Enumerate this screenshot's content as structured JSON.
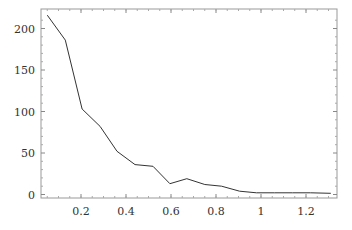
{
  "chart_data": {
    "type": "line",
    "title": "",
    "xlabel": "",
    "ylabel": "",
    "xlim": [
      0.0,
      1.34
    ],
    "ylim": [
      -4,
      224
    ],
    "grid": false,
    "legend": null,
    "x_ticks": [
      0.2,
      0.4,
      0.6,
      0.8,
      1,
      1.2
    ],
    "x_tick_labels": [
      "0.2",
      "0.4",
      "0.6",
      "0.8",
      "1",
      "1.2"
    ],
    "y_ticks": [
      0,
      50,
      100,
      150,
      200
    ],
    "y_tick_labels": [
      "0",
      "50",
      "100",
      "150",
      "200"
    ],
    "series": [
      {
        "name": "series-1",
        "color": "#333333",
        "x": [
          0.05,
          0.13,
          0.205,
          0.285,
          0.36,
          0.44,
          0.52,
          0.595,
          0.67,
          0.75,
          0.825,
          0.905,
          0.98,
          1.06,
          1.14,
          1.22,
          1.31
        ],
        "y": [
          216,
          186,
          103,
          82,
          52,
          36,
          34,
          13,
          19,
          12,
          10,
          4,
          2,
          2,
          2,
          2,
          1.5
        ]
      }
    ]
  },
  "colors": {
    "line": "#333333",
    "frame": "#999999",
    "background": "#ffffff"
  }
}
